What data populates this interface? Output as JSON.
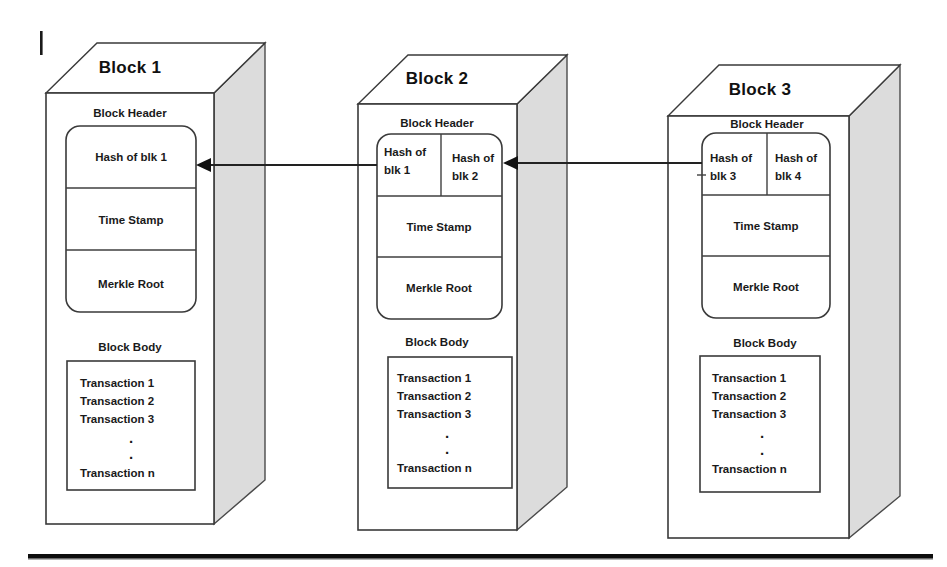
{
  "page": {
    "background_color": "#ffffff",
    "line_color": "#3a3a3a",
    "side_face_color": "#dcdcdc",
    "arrow_color": "#111111"
  },
  "labels": {
    "block_header": "Block Header",
    "block_body": "Block Body",
    "time_stamp": "Time Stamp",
    "merkle_root": "Merkle Root",
    "ellipsis_dot": "."
  },
  "transactions": [
    "Transaction 1",
    "Transaction 2",
    "Transaction 3",
    "Transaction n"
  ],
  "blocks": [
    {
      "title": "Block 1",
      "header_label": "Block Header",
      "hash_cells": [
        "Hash of blk 1"
      ],
      "time_stamp": "Time Stamp",
      "merkle_root": "Merkle Root",
      "body_label": "Block Body",
      "transactions": [
        "Transaction 1",
        "Transaction 2",
        "Transaction 3",
        "Transaction n"
      ]
    },
    {
      "title": "Block 2",
      "header_label": "Block Header",
      "hash_cells": [
        "Hash of\nblk 1",
        "Hash of\nblk 2"
      ],
      "hash_cells_lines": [
        [
          "Hash of",
          "blk 1"
        ],
        [
          "Hash of",
          "blk 2"
        ]
      ],
      "time_stamp": "Time Stamp",
      "merkle_root": "Merkle Root",
      "body_label": "Block Body",
      "transactions": [
        "Transaction 1",
        "Transaction 2",
        "Transaction 3",
        "Transaction n"
      ]
    },
    {
      "title": "Block 3",
      "header_label": "Block Header",
      "hash_cells": [
        "Hash of\nblk 3",
        "Hash of\nblk 4"
      ],
      "hash_cells_lines": [
        [
          "Hash of",
          "blk 3"
        ],
        [
          "Hash of",
          "blk 4"
        ]
      ],
      "time_stamp": "Time Stamp",
      "merkle_root": "Merkle Root",
      "body_label": "Block Body",
      "transactions": [
        "Transaction 1",
        "Transaction 2",
        "Transaction 3",
        "Transaction n"
      ]
    }
  ],
  "arrows": [
    {
      "name": "arrow-block2-to-block1",
      "direction": "left"
    },
    {
      "name": "arrow-block3-to-block2",
      "direction": "left"
    }
  ]
}
